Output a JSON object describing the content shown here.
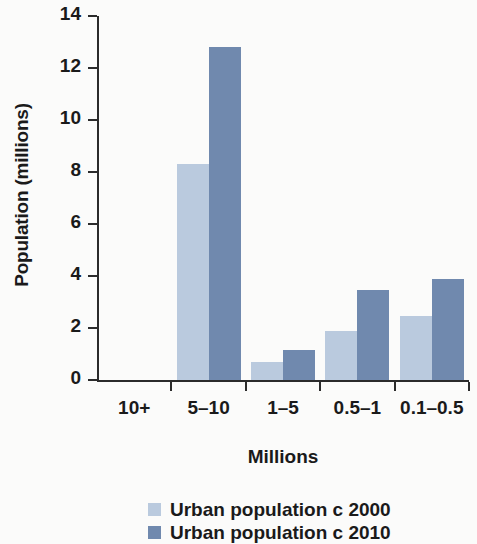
{
  "chart_data": {
    "type": "bar",
    "title": "",
    "xlabel": "Millions",
    "ylabel": "Population (millions)",
    "categories": [
      "10+",
      "5–10",
      "1–5",
      "0.5–1",
      "0.1–0.5"
    ],
    "series": [
      {
        "name": "Urban population c 2000",
        "color": "#bacade",
        "values": [
          0,
          8.3,
          0.7,
          1.9,
          2.45
        ]
      },
      {
        "name": "Urban population c 2010",
        "color": "#7089ae",
        "values": [
          0,
          12.8,
          1.15,
          3.45,
          3.9
        ]
      }
    ],
    "ylim": [
      0,
      14
    ],
    "yticks": [
      0,
      2,
      4,
      6,
      8,
      10,
      12,
      14
    ],
    "ytick_labels": [
      "0",
      "2",
      "4",
      "6",
      "8",
      "10",
      "12",
      "14"
    ],
    "grid": false,
    "legend_position": "bottom"
  },
  "legend": {
    "entries": [
      {
        "label": "Urban population c 2000",
        "color": "#bacade"
      },
      {
        "label": "Urban population c 2010",
        "color": "#7089ae"
      }
    ]
  },
  "colors": {
    "background": "#fbfbfa",
    "axis": "#2b2b2b",
    "text": "#1a1a1a",
    "series_2000": "#bacade",
    "series_2010": "#7089ae"
  }
}
